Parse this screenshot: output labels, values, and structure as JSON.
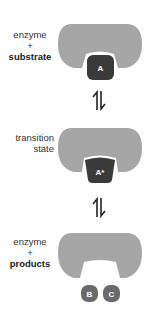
{
  "colors": {
    "enzyme": "#a6a6a6",
    "substrate": "#3a3a3a",
    "transition": "#3a3a3a",
    "products": "#6a6a6a",
    "arrow": "#222222"
  },
  "stages": [
    {
      "line1": "enzyme",
      "line2": "+",
      "line3": "substrate",
      "molecule": "A"
    },
    {
      "line1": "transition",
      "line2": "state",
      "molecule": "A*"
    },
    {
      "line1": "enzyme",
      "line2": "+",
      "line3": "products",
      "molecules": [
        "B",
        "C"
      ]
    }
  ],
  "arrows": [
    "equilibrium-arrow",
    "equilibrium-arrow"
  ]
}
